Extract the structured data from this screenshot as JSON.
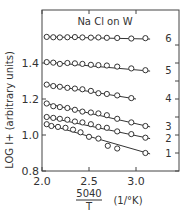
{
  "chart_data": {
    "type": "scatter",
    "title": "Na Cl on W",
    "xlabel": "5040/T (1/°K)",
    "ylabel": "LOG I+ (arbitrary units)",
    "xlim": [
      2.0,
      3.3
    ],
    "ylim": [
      0.8,
      1.6
    ],
    "xticks": [
      "2.0",
      "2.5",
      "3.0"
    ],
    "yticks": [
      "0.8",
      "1.0",
      "1.2",
      "1.4"
    ],
    "grid": false,
    "series": [
      {
        "name": "6",
        "x": [
          2.05,
          2.12,
          2.19,
          2.27,
          2.35,
          2.43,
          2.52,
          2.6,
          2.69,
          2.8,
          2.95,
          3.1
        ],
        "y": [
          1.545,
          1.543,
          1.542,
          1.543,
          1.544,
          1.542,
          1.541,
          1.542,
          1.54,
          1.539,
          1.536,
          1.538
        ]
      },
      {
        "name": "5",
        "x": [
          2.05,
          2.12,
          2.19,
          2.27,
          2.35,
          2.43,
          2.52,
          2.6,
          2.69,
          2.8,
          2.95,
          3.1
        ],
        "y": [
          1.405,
          1.402,
          1.395,
          1.4,
          1.398,
          1.395,
          1.39,
          1.388,
          1.386,
          1.38,
          1.37,
          1.36
        ]
      },
      {
        "name": "4",
        "x": [
          2.05,
          2.12,
          2.19,
          2.27,
          2.35,
          2.43,
          2.52,
          2.6,
          2.69,
          2.8,
          2.95
        ],
        "y": [
          1.28,
          1.272,
          1.268,
          1.262,
          1.258,
          1.254,
          1.245,
          1.232,
          1.228,
          1.22,
          1.205
        ]
      },
      {
        "name": "3",
        "x": [
          2.05,
          2.12,
          2.19,
          2.27,
          2.35,
          2.43,
          2.52,
          2.6,
          2.69,
          2.8,
          2.95,
          3.1
        ],
        "y": [
          1.175,
          1.16,
          1.155,
          1.15,
          1.14,
          1.13,
          1.125,
          1.12,
          1.11,
          1.09,
          1.07,
          1.05
        ]
      },
      {
        "name": "2",
        "x": [
          2.05,
          2.12,
          2.19,
          2.27,
          2.35,
          2.43,
          2.52,
          2.6,
          2.69,
          2.8,
          2.95,
          3.1
        ],
        "y": [
          1.1,
          1.095,
          1.09,
          1.085,
          1.075,
          1.07,
          1.06,
          1.045,
          1.04,
          1.02,
          1.005,
          0.985
        ]
      },
      {
        "name": "1",
        "x": [
          2.05,
          2.1,
          2.17,
          2.25,
          2.33,
          2.41,
          2.5,
          2.6,
          2.7,
          2.8,
          3.1
        ],
        "y": [
          1.06,
          1.05,
          1.045,
          1.04,
          1.03,
          1.015,
          0.99,
          0.98,
          0.94,
          0.925,
          0.9
        ]
      }
    ]
  }
}
